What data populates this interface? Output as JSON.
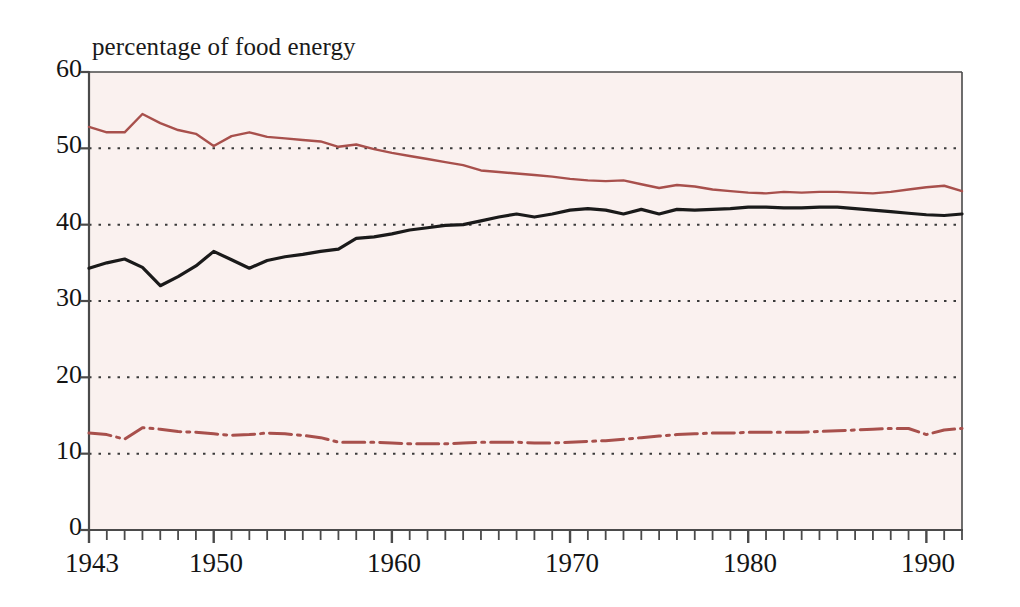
{
  "chart_data": {
    "type": "line",
    "title": "",
    "ylabel": "percentage of food energy",
    "xlabel": "",
    "ylim": [
      0,
      60
    ],
    "xlim": [
      1943,
      1992
    ],
    "grid": true,
    "grid_style": "dotted-horizontal",
    "legend_position": "none",
    "y_ticks": [
      0,
      10,
      20,
      30,
      40,
      50,
      60
    ],
    "x_ticks": [
      1943,
      1950,
      1960,
      1970,
      1980,
      1990
    ],
    "x_minor_tick_interval": 1,
    "x": [
      1943,
      1944,
      1945,
      1946,
      1947,
      1948,
      1949,
      1950,
      1951,
      1952,
      1953,
      1954,
      1955,
      1956,
      1957,
      1958,
      1959,
      1960,
      1961,
      1962,
      1963,
      1964,
      1965,
      1966,
      1967,
      1968,
      1969,
      1970,
      1971,
      1972,
      1973,
      1974,
      1975,
      1976,
      1977,
      1978,
      1979,
      1980,
      1981,
      1982,
      1983,
      1984,
      1985,
      1986,
      1987,
      1988,
      1989,
      1990,
      1991,
      1992
    ],
    "series": [
      {
        "name": "carbohydrate",
        "style": "solid",
        "color": "#a8504c",
        "values": [
          52.8,
          52.1,
          52.1,
          54.5,
          53.3,
          52.4,
          51.9,
          50.3,
          51.6,
          52.1,
          51.5,
          51.3,
          51.1,
          50.9,
          50.2,
          50.5,
          49.9,
          49.4,
          49.0,
          48.6,
          48.2,
          47.8,
          47.1,
          46.9,
          46.7,
          46.5,
          46.3,
          46.0,
          45.8,
          45.7,
          45.8,
          45.3,
          44.8,
          45.2,
          45.0,
          44.6,
          44.4,
          44.2,
          44.1,
          44.3,
          44.2,
          44.3,
          44.3,
          44.2,
          44.1,
          44.3,
          44.6,
          44.9,
          45.1,
          44.4
        ]
      },
      {
        "name": "fat",
        "style": "solid",
        "color": "#1a1a1a",
        "values": [
          34.3,
          35.0,
          35.5,
          34.4,
          32.0,
          33.2,
          34.6,
          36.5,
          35.4,
          34.3,
          35.3,
          35.8,
          36.1,
          36.5,
          36.8,
          38.2,
          38.4,
          38.8,
          39.3,
          39.6,
          39.9,
          40.0,
          40.5,
          41.0,
          41.4,
          41.0,
          41.4,
          41.9,
          42.1,
          41.9,
          41.4,
          42.0,
          41.4,
          42.0,
          41.9,
          42.0,
          42.1,
          42.3,
          42.3,
          42.2,
          42.2,
          42.3,
          42.3,
          42.1,
          41.9,
          41.7,
          41.5,
          41.3,
          41.2,
          41.4
        ]
      },
      {
        "name": "protein",
        "style": "dash-dot",
        "color": "#a8504c",
        "values": [
          12.7,
          12.5,
          11.9,
          13.4,
          13.2,
          12.9,
          12.8,
          12.6,
          12.4,
          12.5,
          12.7,
          12.6,
          12.4,
          12.1,
          11.5,
          11.5,
          11.5,
          11.4,
          11.3,
          11.3,
          11.3,
          11.4,
          11.5,
          11.5,
          11.5,
          11.4,
          11.4,
          11.5,
          11.6,
          11.7,
          11.9,
          12.1,
          12.3,
          12.5,
          12.6,
          12.7,
          12.7,
          12.8,
          12.8,
          12.8,
          12.8,
          12.9,
          13.0,
          13.1,
          13.2,
          13.3,
          13.3,
          12.5,
          13.1,
          13.3
        ]
      }
    ]
  },
  "labels": {
    "y_axis_title": "percentage of food energy",
    "y_tick_0": "0",
    "y_tick_10": "10",
    "y_tick_20": "20",
    "y_tick_30": "30",
    "y_tick_40": "40",
    "y_tick_50": "50",
    "y_tick_60": "60",
    "x_tick_1943": "1943",
    "x_tick_1950": "1950",
    "x_tick_1960": "1960",
    "x_tick_1970": "1970",
    "x_tick_1980": "1980",
    "x_tick_1990": "1990"
  },
  "colors": {
    "plot_background": "#faf1ef",
    "axis": "#4a4a4a",
    "grid": "#3a3a3a",
    "red_line": "#a8504c",
    "black_line": "#1a1a1a",
    "page_background": "#ffffff"
  }
}
